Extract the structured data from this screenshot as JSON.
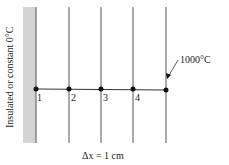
{
  "diagram": {
    "wall_label": "Insulated or constant 0°C",
    "boundary_temp_label": "1000°C",
    "spacing_label": "Δx = 1 cm",
    "nodes": [
      {
        "label": "1",
        "x": 36
      },
      {
        "label": "2",
        "x": 69
      },
      {
        "label": "3",
        "x": 101
      },
      {
        "label": "4",
        "x": 133
      },
      {
        "label": "",
        "x": 166
      }
    ],
    "colors": {
      "wall": "#d4d4d4",
      "line": "#555555",
      "node": "#111111"
    }
  }
}
